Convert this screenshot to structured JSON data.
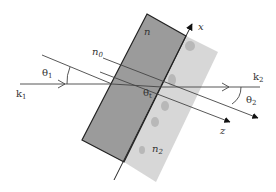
{
  "diagram": {
    "title": "",
    "labels": {
      "k1": "k",
      "k1_sub": "1",
      "k2": "k",
      "k2_sub": "2",
      "theta1": "θ",
      "theta1_sub": "1",
      "theta2": "θ",
      "theta2_sub": "2",
      "thetat": "θ",
      "thetat_sub": "t",
      "n": "n",
      "n0": "n",
      "n0_sub": "0",
      "n2": "n",
      "n2_sub": "2",
      "x_axis": "x",
      "z_axis": "z"
    },
    "colors": {
      "slab_fill": "#9a9a9a",
      "substrate_fill": "#d6d6d6",
      "line": "#222222",
      "ray_line": "#444444"
    }
  }
}
